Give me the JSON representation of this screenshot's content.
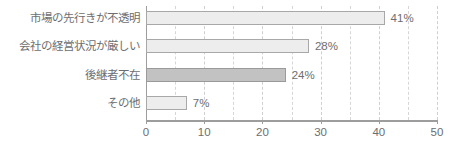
{
  "chart_data": {
    "type": "bar",
    "orientation": "horizontal",
    "title": "",
    "xlabel": "",
    "ylabel": "",
    "xlim": [
      0,
      50
    ],
    "grid": true,
    "grid_major_step": 10,
    "grid_minor_step": 5,
    "legend": null,
    "unit_suffix": "%",
    "categories": [
      "市場の先行きが不透明",
      "会社の経営状況が厳しい",
      "後継者不在",
      "その他"
    ],
    "values": [
      41,
      28,
      24,
      7
    ],
    "value_labels": [
      "41%",
      "28%",
      "24%",
      "7%"
    ],
    "highlight_index": 2,
    "tick_values": [
      0,
      10,
      20,
      30,
      40,
      50
    ],
    "tick_labels": [
      "0",
      "10",
      "20",
      "30",
      "40",
      "50"
    ],
    "minor_tick_values": [
      5,
      15,
      25,
      35,
      45
    ],
    "colors": {
      "bar_fill": "#ededed",
      "bar_stroke": "#a8a8a8",
      "bar_fill_highlight": "#c2c2c2",
      "bar_stroke_highlight": "#9a9a9a",
      "axis": "#9d9d9d",
      "gridline": "#d6d6d6",
      "text": "#6d6e71",
      "background": "#ffffff"
    }
  },
  "title_sliver": {
    "left_fragment": "",
    "mid_fragment": ""
  }
}
